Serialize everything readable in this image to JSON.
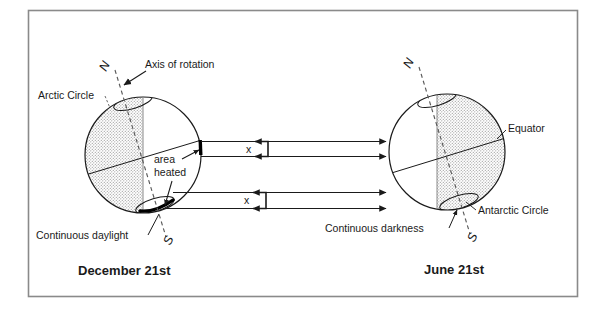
{
  "figure": {
    "title_left": "December 21st",
    "title_right": "June 21st",
    "border_color": "#8a8a8a",
    "ink_color": "#1a1a1a",
    "stipple_color": "#9a9a9a",
    "background": "#ffffff"
  },
  "left_panel": {
    "caption": "December 21st",
    "north_pole": "N",
    "south_pole": "S",
    "labels": {
      "axis_of_rotation": "Axis of rotation",
      "arctic_circle": "Arctic Circle",
      "area_heated_line1": "area",
      "area_heated_line2": "heated",
      "continuous_daylight": "Continuous daylight"
    },
    "ray_bracket_label_top": "x",
    "ray_bracket_label_bottom": "x",
    "shaded_side": "left",
    "shading_meaning": "night / unlit hemisphere"
  },
  "right_panel": {
    "caption": "June 21st",
    "north_pole": "N",
    "south_pole": "S",
    "labels": {
      "equator": "Equator",
      "antarctic_circle": "Antarctic Circle",
      "continuous_darkness": "Continuous darkness"
    },
    "shaded_side": "right",
    "shading_meaning": "night / unlit hemisphere"
  },
  "rays": {
    "count": 4,
    "direction": "left-to-right",
    "description": "parallel sunlight rays travelling from the December globe toward the June globe"
  }
}
